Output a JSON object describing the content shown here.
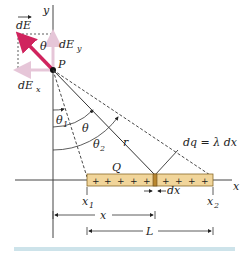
{
  "diagram": {
    "labels": {
      "y_axis": "y",
      "x_axis": "x",
      "dE": "dE",
      "dEy": "dE",
      "dEy_sub": "y",
      "dEx": "dE",
      "dEx_sub": "x",
      "theta_top": "θ",
      "point": "P",
      "theta1": "θ",
      "theta1_sub": "1",
      "theta": "θ",
      "theta2": "θ",
      "theta2_sub": "2",
      "r": "r",
      "charge": "Q",
      "dq_eq": "dq = λ dx",
      "dx": "dx",
      "x1": "x",
      "x1_sub": "1",
      "x2": "x",
      "x2_sub": "2",
      "x_dim": "x",
      "L_dim": "L"
    },
    "plus_signs_left": [
      "+",
      "+",
      "+",
      "+",
      "+"
    ],
    "plus_signs_right": [
      "+",
      "+",
      "+",
      "+"
    ],
    "colors": {
      "field_vector": "#d0245e",
      "component_vectors": "#e6c6d8",
      "rod_fill": "#f1d59a",
      "rod_stroke": "#8a6a2a",
      "element_fill": "#b8862f",
      "axis": "#333333",
      "footer_bar": "#cde3ea"
    }
  }
}
